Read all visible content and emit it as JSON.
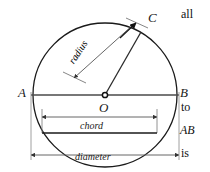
{
  "figure": {
    "caption_alt": "Circle with centre O, diameter AB, radius OC, chord and diameter dimension lines",
    "colors": {
      "stroke": "#1a1a1a",
      "dim_line": "#555555",
      "background": "#ffffff",
      "text": "#111111"
    },
    "geometry": {
      "center": {
        "x": 105,
        "y": 95
      },
      "radius": 72,
      "point_A": {
        "x": 33,
        "y": 95
      },
      "point_B": {
        "x": 177,
        "y": 95
      },
      "point_C": {
        "x": 140,
        "y": 32
      },
      "chord_y": 133,
      "chord_x1": 42,
      "chord_x2": 157,
      "diameter_dim_y": 155,
      "chord_dim_y": 117
    },
    "point_labels": [
      {
        "name": "label-A",
        "text": "A",
        "x": 18,
        "y": 86
      },
      {
        "name": "label-B",
        "text": "B",
        "x": 180,
        "y": 86
      },
      {
        "name": "label-C",
        "text": "C",
        "x": 148,
        "y": 11
      },
      {
        "name": "label-O",
        "text": "O",
        "x": 99,
        "y": 101
      }
    ],
    "dimension_labels": [
      {
        "name": "radius-dimension-label",
        "text": "radius"
      },
      {
        "name": "chord-dimension-label",
        "text": "chord",
        "x": 80,
        "y": 121
      },
      {
        "name": "diameter-dimension-label",
        "text": "diameter",
        "x": 75,
        "y": 152
      }
    ]
  },
  "body_text_fragments": [
    {
      "name": "text-fragment-all",
      "text": "all",
      "x": 181,
      "y": 8,
      "italic": false
    },
    {
      "name": "text-fragment-to",
      "text": "to",
      "x": 181,
      "y": 101,
      "italic": false
    },
    {
      "name": "text-fragment-ab",
      "text": "AB",
      "x": 180,
      "y": 124,
      "italic": true
    },
    {
      "name": "text-fragment-is",
      "text": "is",
      "x": 181,
      "y": 147,
      "italic": false
    }
  ]
}
